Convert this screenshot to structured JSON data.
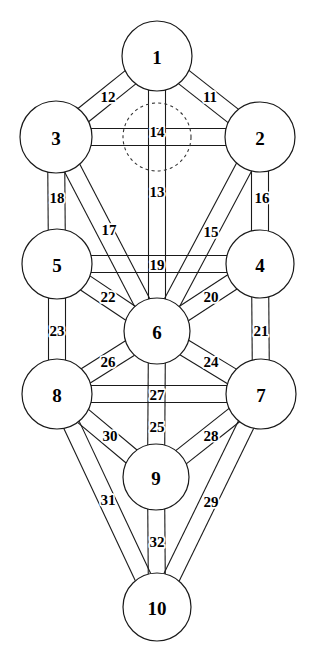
{
  "diagram": {
    "width": 313,
    "height": 663,
    "background_color": "#ffffff",
    "line_color": "#1a1a1a",
    "label_color": "#000000",
    "band_width": 17,
    "sephirot": [
      {
        "id": "s1",
        "label": "1",
        "cx": 157,
        "cy": 56,
        "r": 35
      },
      {
        "id": "s2",
        "label": "2",
        "cx": 260,
        "cy": 137,
        "r": 35
      },
      {
        "id": "s3",
        "label": "3",
        "cx": 56,
        "cy": 137,
        "r": 36
      },
      {
        "id": "s4",
        "label": "4",
        "cx": 260,
        "cy": 264,
        "r": 34
      },
      {
        "id": "s5",
        "label": "5",
        "cx": 57,
        "cy": 264,
        "r": 35
      },
      {
        "id": "s6",
        "label": "6",
        "cx": 157,
        "cy": 331,
        "r": 33
      },
      {
        "id": "s7",
        "label": "7",
        "cx": 261,
        "cy": 394,
        "r": 35
      },
      {
        "id": "s8",
        "label": "8",
        "cx": 57,
        "cy": 394,
        "r": 35
      },
      {
        "id": "s9",
        "label": "9",
        "cx": 156,
        "cy": 477,
        "r": 33
      },
      {
        "id": "s10",
        "label": "10",
        "cx": 157,
        "cy": 607,
        "r": 34
      }
    ],
    "hidden_sephira": {
      "id": "daat",
      "label": "",
      "cx": 157,
      "cy": 137,
      "r": 34,
      "style": "dashed"
    },
    "paths": [
      {
        "label": "11",
        "from": "s1",
        "to": "s2",
        "label_x": 210,
        "label_y": 97
      },
      {
        "label": "12",
        "from": "s1",
        "to": "s3",
        "label_x": 108,
        "label_y": 97
      },
      {
        "label": "13",
        "from": "s1",
        "to": "s6",
        "label_x": 157,
        "label_y": 192
      },
      {
        "label": "14",
        "from": "s3",
        "to": "s2",
        "label_x": 157,
        "label_y": 132
      },
      {
        "label": "15",
        "from": "s2",
        "to": "s6",
        "label_x": 211,
        "label_y": 232
      },
      {
        "label": "16",
        "from": "s2",
        "to": "s4",
        "label_x": 262,
        "label_y": 198
      },
      {
        "label": "17",
        "from": "s3",
        "to": "s6",
        "label_x": 109,
        "label_y": 230
      },
      {
        "label": "18",
        "from": "s3",
        "to": "s5",
        "label_x": 57,
        "label_y": 198
      },
      {
        "label": "19",
        "from": "s5",
        "to": "s4",
        "label_x": 157,
        "label_y": 265
      },
      {
        "label": "20",
        "from": "s4",
        "to": "s6",
        "label_x": 211,
        "label_y": 297
      },
      {
        "label": "21",
        "from": "s4",
        "to": "s7",
        "label_x": 261,
        "label_y": 331
      },
      {
        "label": "22",
        "from": "s5",
        "to": "s6",
        "label_x": 108,
        "label_y": 297
      },
      {
        "label": "23",
        "from": "s5",
        "to": "s8",
        "label_x": 57,
        "label_y": 331
      },
      {
        "label": "24",
        "from": "s6",
        "to": "s7",
        "label_x": 211,
        "label_y": 362
      },
      {
        "label": "25",
        "from": "s6",
        "to": "s9",
        "label_x": 157,
        "label_y": 427
      },
      {
        "label": "26",
        "from": "s6",
        "to": "s8",
        "label_x": 108,
        "label_y": 362
      },
      {
        "label": "27",
        "from": "s8",
        "to": "s7",
        "label_x": 157,
        "label_y": 395
      },
      {
        "label": "28",
        "from": "s7",
        "to": "s9",
        "label_x": 211,
        "label_y": 436
      },
      {
        "label": "29",
        "from": "s7",
        "to": "s10",
        "label_x": 211,
        "label_y": 502
      },
      {
        "label": "30",
        "from": "s8",
        "to": "s9",
        "label_x": 110,
        "label_y": 436
      },
      {
        "label": "31",
        "from": "s8",
        "to": "s10",
        "label_x": 108,
        "label_y": 500
      },
      {
        "label": "32",
        "from": "s9",
        "to": "s10",
        "label_x": 157,
        "label_y": 542
      }
    ]
  }
}
